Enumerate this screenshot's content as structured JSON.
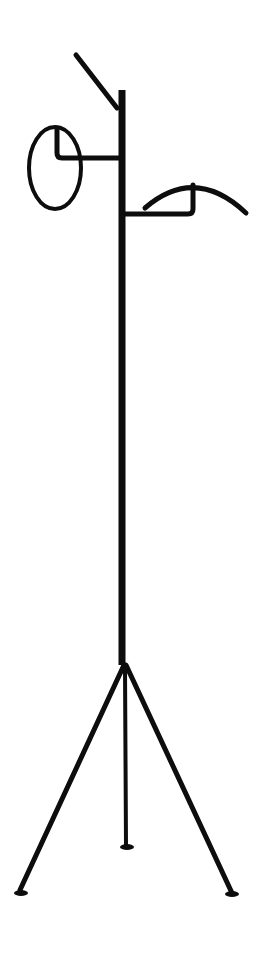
{
  "image": {
    "subject": "black metal coat stand",
    "background_color": "#ffffff",
    "object_color": "#0d0d0d",
    "parts": [
      "diagonal top hook",
      "vertical pole",
      "ring hanger",
      "curved arc hanger",
      "tripod base with center leg"
    ]
  }
}
